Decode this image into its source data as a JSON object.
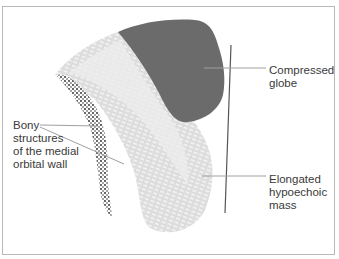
{
  "figure": {
    "type": "anatomical ultrasound schematic",
    "colors": {
      "globe": "#6b6b6b",
      "mass_light": "#e6e6e6",
      "mass_mid": "#d2d2d2",
      "bone_dots": "#222222",
      "leader_line": "#a0a0a0",
      "frame": "#b8b8b8",
      "text": "#3a3a3a"
    }
  },
  "labels": {
    "globe": "Compressed\nglobe",
    "bony": "Bony\nstructures\nof the medial\norbital wall",
    "mass": "Elongated\nhypoechoic\nmass"
  }
}
